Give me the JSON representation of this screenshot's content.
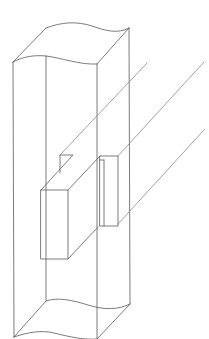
{
  "figure": {
    "title": "",
    "background": "#ffffff",
    "stroke_color": "#5a5a5a",
    "components": [
      {
        "name": "post",
        "label": ""
      },
      {
        "name": "beam-tenon",
        "label": ""
      },
      {
        "name": "mortise-notch",
        "label": ""
      }
    ]
  }
}
